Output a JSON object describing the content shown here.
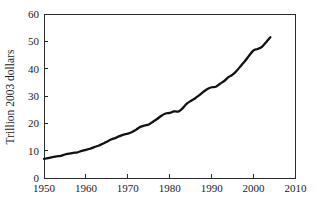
{
  "chart_data": {
    "type": "line",
    "title": "",
    "subtitle": "",
    "xlabel": "",
    "ylabel": "Trillion 2003 dollars",
    "xlim": [
      1950,
      2010
    ],
    "ylim": [
      0,
      60
    ],
    "xticks": [
      1950,
      1960,
      1970,
      1980,
      1990,
      2000,
      2010
    ],
    "yticks": [
      0,
      10,
      20,
      30,
      40,
      50,
      60
    ],
    "xtick_labels": [
      "1950",
      "1960",
      "1970",
      "1980",
      "1990",
      "2000",
      "2010"
    ],
    "ytick_labels": [
      "0",
      "10",
      "20",
      "30",
      "40",
      "50",
      "60"
    ],
    "grid": false,
    "legend": null,
    "legend_position": "none",
    "line_color": "#111111",
    "axis_color": "#2b2b2b",
    "series": [
      {
        "name": "Real GDP",
        "color": "#111111",
        "x": [
          1950,
          1951,
          1952,
          1953,
          1954,
          1955,
          1956,
          1957,
          1958,
          1959,
          1960,
          1961,
          1962,
          1963,
          1964,
          1965,
          1966,
          1967,
          1968,
          1969,
          1970,
          1971,
          1972,
          1973,
          1974,
          1975,
          1976,
          1977,
          1978,
          1979,
          1980,
          1981,
          1982,
          1983,
          1984,
          1985,
          1986,
          1987,
          1988,
          1989,
          1990,
          1991,
          1992,
          1993,
          1994,
          1995,
          1996,
          1997,
          1998,
          1999,
          2000,
          2001,
          2002,
          2003,
          2004
        ],
        "values": [
          7.0,
          7.3,
          7.6,
          7.9,
          8.1,
          8.6,
          8.9,
          9.2,
          9.4,
          9.9,
          10.3,
          10.7,
          11.3,
          11.8,
          12.5,
          13.3,
          14.1,
          14.6,
          15.3,
          15.9,
          16.2,
          16.8,
          17.7,
          18.7,
          19.2,
          19.6,
          20.6,
          21.6,
          22.8,
          23.6,
          23.8,
          24.4,
          24.3,
          25.4,
          27.1,
          28.2,
          29.1,
          30.2,
          31.5,
          32.6,
          33.2,
          33.4,
          34.5,
          35.5,
          36.9,
          37.8,
          39.3,
          41.1,
          42.9,
          44.9,
          46.7,
          47.2,
          48.0,
          49.7,
          51.5
        ]
      }
    ]
  }
}
